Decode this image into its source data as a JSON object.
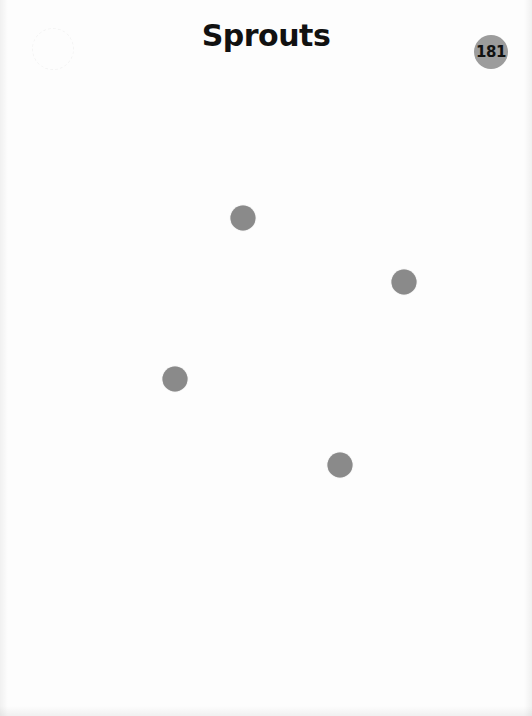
{
  "page": {
    "title": "Sprouts",
    "page_number": "181"
  },
  "colors": {
    "background": "#fdfdfd",
    "title": "#111111",
    "badge_fill": "#9c9c9c",
    "dot_fill": "#8a8a8a"
  },
  "game": {
    "name": "Sprouts",
    "dots": [
      {
        "id": 1,
        "x": 243,
        "y": 218
      },
      {
        "id": 2,
        "x": 404,
        "y": 282
      },
      {
        "id": 3,
        "x": 175,
        "y": 379
      },
      {
        "id": 4,
        "x": 340,
        "y": 465
      }
    ]
  }
}
